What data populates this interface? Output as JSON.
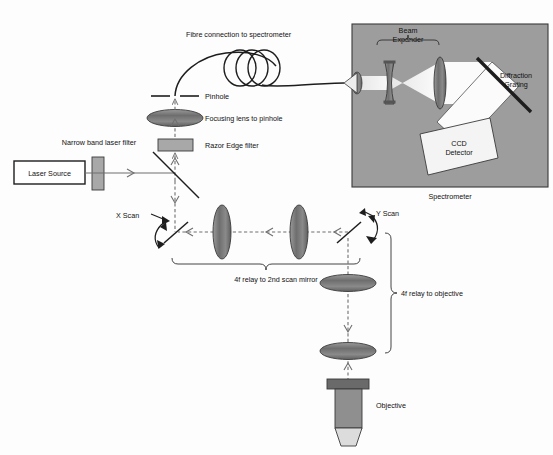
{
  "diagram": {
    "background_color": "#fdfdfd",
    "line_color": "#3b3b3b",
    "beam_color": "#6f6f6f",
    "spectrometer_fill": "#9d9d9d",
    "lens_fill": "#7d7d7d",
    "filter_fill": "#a8a8a8",
    "objective_body": "#8f8f8f",
    "objective_cap": "#6a6a6a",
    "detector_fill": "#f4f4f4"
  },
  "labels": {
    "laser_source": "Laser Source",
    "narrow_band_laser_filter": "Narrow band laser filter",
    "razor_edge_filter": "Razor Edge filter",
    "focusing_lens_to_pinhole": "Focusing lens to pinhole",
    "pinhole": "Pinhole",
    "fibre_connection": "Fibre connection to spectrometer",
    "x_scan": "X Scan",
    "y_scan": "Y Scan",
    "relay_2nd_scan_mirror": "4f relay to 2nd scan mirror",
    "relay_objective": "4f relay to objective",
    "objective": "Objective",
    "spectrometer": "Spectrometer",
    "beam_expander_line1": "Beam",
    "beam_expander_line2": "Expander",
    "diffraction_grating_line1": "Diffraction",
    "diffraction_grating_line2": "Grating",
    "ccd_detector_line1": "CCD",
    "ccd_detector_line2": "Detector"
  }
}
